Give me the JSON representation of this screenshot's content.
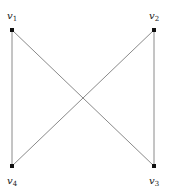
{
  "graph": {
    "vertices": [
      {
        "id": "v1",
        "name": "v",
        "sub": "1",
        "x": 12,
        "y": 30,
        "lx": 9,
        "ly": 19
      },
      {
        "id": "v2",
        "name": "v",
        "sub": "2",
        "x": 154,
        "y": 30,
        "lx": 150,
        "ly": 19
      },
      {
        "id": "v3",
        "name": "v",
        "sub": "3",
        "x": 154,
        "y": 166,
        "lx": 150,
        "ly": 185
      },
      {
        "id": "v4",
        "name": "v",
        "sub": "4",
        "x": 12,
        "y": 166,
        "lx": 9,
        "ly": 185
      }
    ],
    "edges": [
      [
        "v1",
        "v4"
      ],
      [
        "v2",
        "v3"
      ],
      [
        "v1",
        "v3"
      ],
      [
        "v2",
        "v4"
      ]
    ],
    "colors": {
      "edge": "#8a8a8a",
      "vertex": "#111111",
      "label": "#222222"
    }
  }
}
